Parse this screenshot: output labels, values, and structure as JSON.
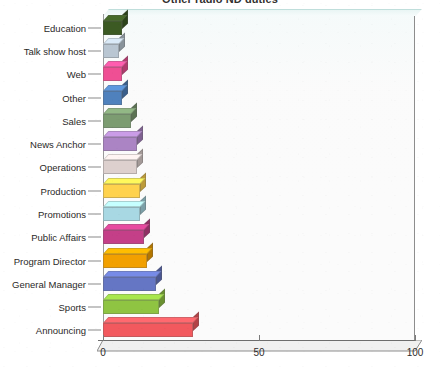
{
  "chart_data": {
    "type": "bar",
    "orientation": "horizontal",
    "title": "Other radio ND duties",
    "xlabel": "",
    "ylabel": "",
    "xlim": [
      0,
      100
    ],
    "xticks": [
      0,
      50,
      100
    ],
    "xtick_labels": [
      "0",
      "50",
      "100"
    ],
    "grid": false,
    "legend": "none",
    "style": "3d-bar",
    "categories": [
      "Education",
      "Talk show host",
      "Web",
      "Other",
      "Sales",
      "News Anchor",
      "Operations",
      "Production",
      "Promotions",
      "Public Affairs",
      "Program Director",
      "General Manager",
      "Sports",
      "Announcing"
    ],
    "values": [
      6,
      5,
      6,
      6,
      9,
      11,
      11,
      12,
      12,
      13,
      14,
      17,
      18,
      29
    ],
    "colors": [
      "#3c5a23",
      "#b9c6d2",
      "#ef4f94",
      "#4f81bd",
      "#7c9c71",
      "#ab84c4",
      "#ddd0ce",
      "#ffd24d",
      "#a8d8e3",
      "#c43f88",
      "#f2a000",
      "#6576c4",
      "#8fc442",
      "#f2595e"
    ],
    "series": [
      {
        "name": "Other radio ND duties",
        "values": [
          6,
          5,
          6,
          6,
          9,
          11,
          11,
          12,
          12,
          13,
          14,
          17,
          18,
          29
        ]
      }
    ]
  },
  "axis": {
    "x_tick_labels": [
      "0",
      "50",
      "100"
    ]
  }
}
